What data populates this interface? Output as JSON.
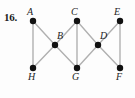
{
  "figure": {
    "problem_number": "16.",
    "caption": "",
    "background_color": "#fdfdfd",
    "edge_color": "#b0b0b0",
    "vertex_color": "#111111",
    "label_color": "#1d1d1d"
  },
  "graph": {
    "type": "undirected-graph",
    "vertices": [
      {
        "id": "A",
        "label": "A",
        "x": 33,
        "y": 21,
        "label_x": 27,
        "label_y": 7,
        "label_pos": "above-left"
      },
      {
        "id": "B",
        "label": "B",
        "x": 55,
        "y": 45,
        "label_x": 57,
        "label_y": 31,
        "label_pos": "above-right"
      },
      {
        "id": "C",
        "label": "C",
        "x": 77,
        "y": 21,
        "label_x": 71,
        "label_y": 7,
        "label_pos": "above-left"
      },
      {
        "id": "D",
        "label": "D",
        "x": 98,
        "y": 45,
        "label_x": 100,
        "label_y": 31,
        "label_pos": "above-right"
      },
      {
        "id": "E",
        "label": "E",
        "x": 120,
        "y": 21,
        "label_x": 114,
        "label_y": 7,
        "label_pos": "above-left"
      },
      {
        "id": "F",
        "label": "F",
        "x": 120,
        "y": 68,
        "label_x": 116,
        "label_y": 72,
        "label_pos": "below"
      },
      {
        "id": "G",
        "label": "G",
        "x": 77,
        "y": 68,
        "label_x": 72,
        "label_y": 72,
        "label_pos": "below"
      },
      {
        "id": "H",
        "label": "H",
        "x": 33,
        "y": 68,
        "label_x": 28,
        "label_y": 72,
        "label_pos": "below"
      }
    ],
    "edges": [
      {
        "from": "A",
        "to": "H"
      },
      {
        "from": "A",
        "to": "B"
      },
      {
        "from": "H",
        "to": "B"
      },
      {
        "from": "B",
        "to": "C"
      },
      {
        "from": "B",
        "to": "G"
      },
      {
        "from": "C",
        "to": "G"
      },
      {
        "from": "C",
        "to": "D"
      },
      {
        "from": "G",
        "to": "D"
      },
      {
        "from": "D",
        "to": "E"
      },
      {
        "from": "D",
        "to": "F"
      },
      {
        "from": "E",
        "to": "F"
      }
    ],
    "vertex_radius": 3.2,
    "edge_width": 1.4
  }
}
